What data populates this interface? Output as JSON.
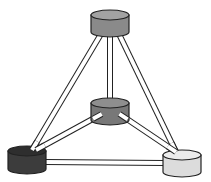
{
  "diagram": {
    "type": "tetrahedral-network",
    "nodes": [
      {
        "id": "top",
        "fill": "#8a8a8a",
        "top_fill": "#a2a2a2",
        "cx": 110,
        "cy": 15,
        "rx": 19,
        "ry": 5,
        "h": 17
      },
      {
        "id": "center",
        "fill": "#787878",
        "top_fill": "#8e8e8e",
        "cx": 110,
        "cy": 103,
        "rx": 19,
        "ry": 5,
        "h": 17
      },
      {
        "id": "bottom-left",
        "fill": "#3c3c3c",
        "top_fill": "#2e2e2e",
        "cx": 27,
        "cy": 151,
        "rx": 19,
        "ry": 5,
        "h": 18
      },
      {
        "id": "bottom-right",
        "fill": "#dcdcdc",
        "top_fill": "#ececec",
        "cx": 182,
        "cy": 155,
        "rx": 19,
        "ry": 5,
        "h": 17
      }
    ],
    "edges": [
      {
        "from": "top",
        "to": "bottom-left",
        "x1": 101,
        "y1": 34,
        "x2": 32,
        "y2": 150
      },
      {
        "from": "top",
        "to": "bottom-right",
        "x1": 119,
        "y1": 34,
        "x2": 176,
        "y2": 152
      },
      {
        "from": "top",
        "to": "center",
        "x1": 110,
        "y1": 34,
        "x2": 110,
        "y2": 100
      },
      {
        "from": "center",
        "to": "bottom-left",
        "x1": 100,
        "y1": 115,
        "x2": 36,
        "y2": 150
      },
      {
        "from": "center",
        "to": "bottom-right",
        "x1": 121,
        "y1": 115,
        "x2": 176,
        "y2": 152
      },
      {
        "from": "bottom-left",
        "to": "bottom-right",
        "x1": 45,
        "y1": 162,
        "x2": 164,
        "y2": 163
      }
    ]
  }
}
